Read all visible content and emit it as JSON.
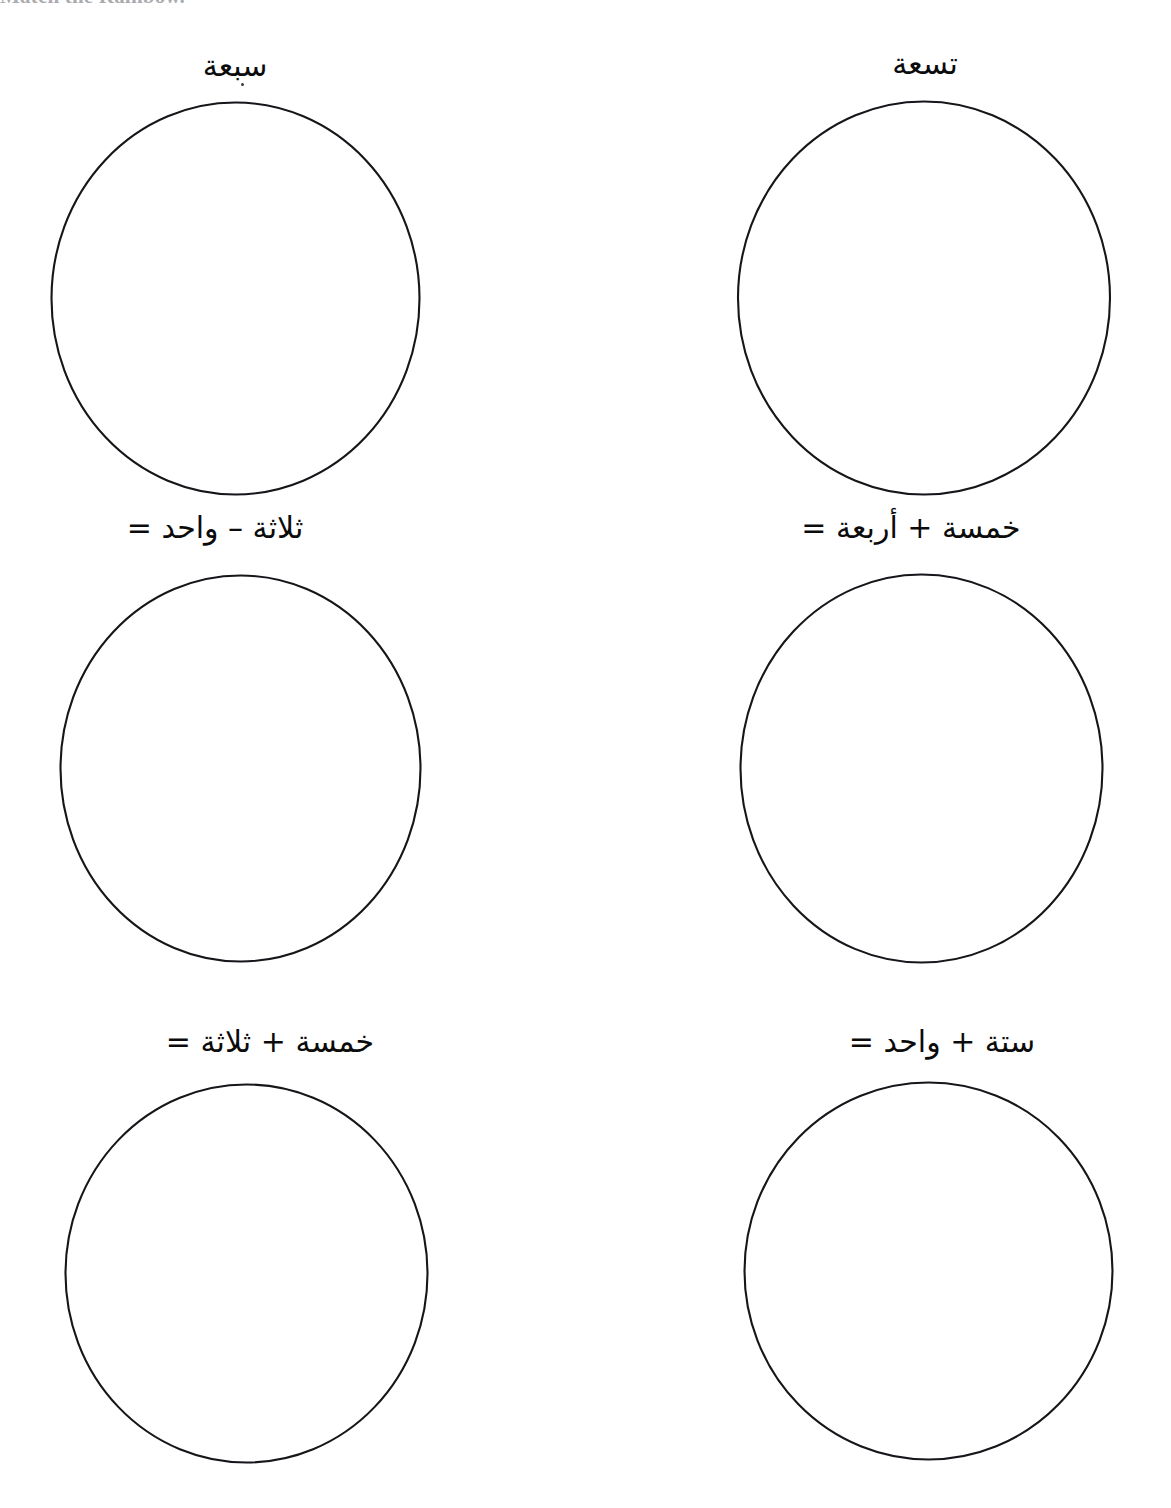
{
  "document": {
    "title": "Arabic Numbers Worksheet",
    "language": "ar",
    "background_color": "#ffffff",
    "ink_color": "#15151a",
    "cut_off_header": "Match the Rainbow."
  },
  "problems": [
    {
      "id": "problem-1",
      "position": "top-left",
      "label": "سبعة",
      "type": "number-word",
      "answer_shape": "circle"
    },
    {
      "id": "problem-2",
      "position": "top-right",
      "label": "تسعة",
      "type": "number-word",
      "answer_shape": "circle"
    },
    {
      "id": "problem-3",
      "position": "middle-left",
      "label": "ثلاثة – واحد =",
      "type": "equation",
      "answer_shape": "circle"
    },
    {
      "id": "problem-4",
      "position": "middle-right",
      "label": "خمسة + أربعة =",
      "type": "equation",
      "answer_shape": "circle"
    },
    {
      "id": "problem-5",
      "position": "bottom-left",
      "label": "خمسة + ثلاثة =",
      "type": "equation",
      "answer_shape": "circle"
    },
    {
      "id": "problem-6",
      "position": "bottom-right",
      "label": "ستة + واحد =",
      "type": "equation",
      "answer_shape": "circle"
    }
  ]
}
